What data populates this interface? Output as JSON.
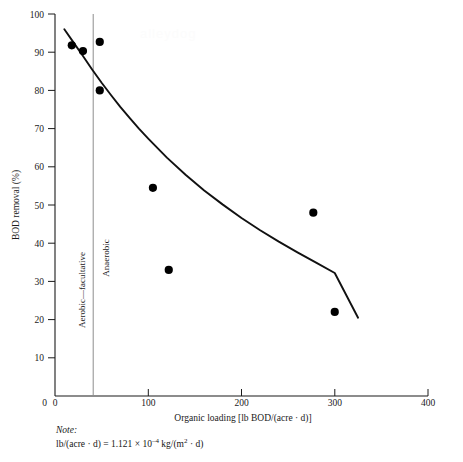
{
  "chart_data": {
    "type": "scatter",
    "title": "",
    "xlabel": "Organic loading [lb BOD/(acre · d)]",
    "ylabel": "BOD removal (%)",
    "xlim": [
      0,
      400
    ],
    "ylim": [
      0,
      100
    ],
    "xticks": [
      0,
      100,
      200,
      300,
      400
    ],
    "yticks": [
      0,
      10,
      20,
      30,
      40,
      50,
      60,
      70,
      80,
      90,
      100
    ],
    "xtick_labels": [
      "0",
      "100",
      "200",
      "300",
      "400"
    ],
    "ytick_labels": [
      "0",
      "10",
      "20",
      "30",
      "40",
      "50",
      "60",
      "70",
      "80",
      "90",
      "100"
    ],
    "grid": false,
    "legend": false,
    "points": [
      {
        "x": 18,
        "y": 91.8
      },
      {
        "x": 30,
        "y": 90.3
      },
      {
        "x": 48,
        "y": 92.7
      },
      {
        "x": 48,
        "y": 80.0
      },
      {
        "x": 105,
        "y": 54.5
      },
      {
        "x": 122,
        "y": 33.0
      },
      {
        "x": 277,
        "y": 48.0
      },
      {
        "x": 300,
        "y": 22.0
      }
    ],
    "fit_curve": {
      "name": "trend line",
      "x": [
        10,
        20,
        30,
        40,
        50,
        60,
        70,
        80,
        90,
        100,
        120,
        140,
        160,
        180,
        200,
        220,
        240,
        260,
        280,
        300,
        325
      ],
      "y": [
        96.0,
        92.5,
        89.0,
        85.4,
        82.0,
        78.8,
        75.7,
        72.8,
        70.0,
        67.4,
        62.4,
        57.9,
        53.8,
        50.1,
        46.6,
        43.4,
        40.4,
        37.6,
        34.9,
        32.2,
        20.5
      ]
    },
    "annotations": [
      {
        "name": "divider",
        "type": "vline",
        "x": 41
      },
      {
        "name": "left-region",
        "text": "Aerobic—facultative",
        "orientation": "vertical"
      },
      {
        "name": "right-region",
        "text": "Anaerobic",
        "orientation": "vertical"
      }
    ],
    "colors": {
      "axis": "#1a1a1a",
      "point": "#000000",
      "curve": "#111111",
      "divider": "#8d8d8d",
      "background": "#ffffff"
    }
  },
  "note": {
    "heading": "Note:",
    "line": "lb/(acre · d) = 1.121 × 10",
    "exponent": "–4",
    "line_tail": " kg/(m",
    "exponent2": "2",
    "line_tail2": " · d)"
  },
  "watermark": {
    "text": "alleydog"
  }
}
